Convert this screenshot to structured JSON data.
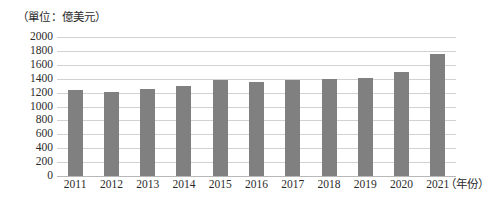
{
  "chart_data": {
    "type": "bar",
    "title": "",
    "unit_caption": "（單位：億美元）",
    "xlabel": "（年份）",
    "ylabel": "",
    "categories": [
      "2011",
      "2012",
      "2013",
      "2014",
      "2015",
      "2016",
      "2017",
      "2018",
      "2019",
      "2020",
      "2021"
    ],
    "values": [
      1240,
      1215,
      1245,
      1300,
      1380,
      1355,
      1385,
      1400,
      1415,
      1500,
      1750
    ],
    "series": [
      {
        "name": "",
        "values": [
          1240,
          1215,
          1245,
          1300,
          1380,
          1355,
          1385,
          1400,
          1415,
          1500,
          1750
        ]
      }
    ],
    "ylim": [
      0,
      2000
    ],
    "ytick_values": [
      2000,
      1800,
      1600,
      1400,
      1200,
      1000,
      800,
      600,
      400,
      200,
      0
    ],
    "ytick_labels": [
      "2000",
      "1800",
      "1600",
      "1400",
      "1200",
      "1000",
      "800",
      "600",
      "400",
      "200",
      "0"
    ],
    "grid": true,
    "legend": false,
    "legend_position": "none",
    "bar_color": "#808080",
    "gridline_color": "#d2d2d2",
    "axis_color": "#b8b8b8",
    "background_color": "#ffffff",
    "text_color": "#2b2b2b"
  }
}
